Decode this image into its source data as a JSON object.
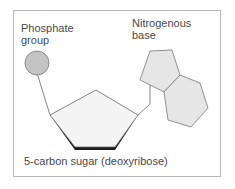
{
  "diagram": {
    "labels": {
      "phosphate_line1": "Phosphate",
      "phosphate_line2": "group",
      "base_line1": "Nitrogenous",
      "base_line2": "base",
      "sugar": "5-carbon sugar (deoxyribose)"
    },
    "colors": {
      "phosphate_fill": "#c4c4c4",
      "base_fill": "#e6e6e6",
      "sugar_fill": "#f4f4f4",
      "sugar_shadow": "#1a1a1a",
      "stroke": "#666666",
      "frame": "#b8b8b8"
    }
  }
}
